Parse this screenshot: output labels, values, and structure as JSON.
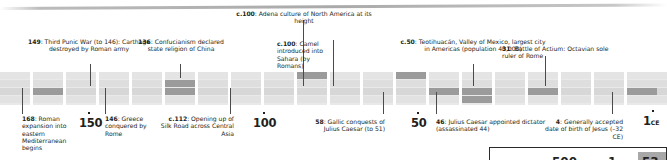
{
  "document": {
    "type": "historical-timeline",
    "period": "2nd century BCE to 1 CE",
    "top_rule": "hairline-divider"
  },
  "events_above": [
    {
      "id": "adena",
      "year_label": "c.100",
      "text": ": Adena culture of North America at its height",
      "lines": [
        "c.100: Adena culture of",
        "North America at its height"
      ],
      "align": "center"
    },
    {
      "id": "punic",
      "year_label": "149",
      "text": ": Third Punic War (to 146): Carthage destroyed by Roman army",
      "lines": [
        "149: Third Punic War",
        "(to 146): Carthage",
        "destroyed by Roman army"
      ],
      "align": "center"
    },
    {
      "id": "confucianism",
      "year_label": "136",
      "text": ": Confucianism declared state religion of China",
      "lines": [
        "136: Confucianism",
        "declared state",
        "religion of China"
      ],
      "align": "center"
    },
    {
      "id": "camel",
      "year_label": "c.100",
      "text": ": Camel introduced into Sahara (by Romans)",
      "lines": [
        "c.100: Camel",
        "introduced into",
        "Sahara (by Romans)"
      ],
      "align": "left"
    },
    {
      "id": "teotihuacan",
      "year_label": "c.50",
      "text": ": Teotihuacán, Valley of Mexico, largest city in Americas (population 40,000)",
      "lines": [
        "c.50: Teotihuacán, Valley",
        "of Mexico, largest city in",
        "Americas (population 40,000)"
      ],
      "align": "center"
    },
    {
      "id": "actium",
      "year_label": "31",
      "text": ": Battle of Actium: Octavian sole ruler of Rome",
      "lines": [
        "31: Battle of Actium:",
        "Octavian sole ruler of Rome"
      ],
      "align": "left"
    }
  ],
  "events_below": [
    {
      "id": "roman-expansion",
      "year_label": "168",
      "text": ": Roman expansion into eastern Mediterranean begins",
      "lines": [
        "168: Roman",
        "expansion",
        "into eastern",
        "Mediterranean",
        "begins"
      ],
      "align": "left"
    },
    {
      "id": "greece",
      "year_label": "146",
      "text": ": Greece conquered by Rome",
      "lines": [
        "146: Greece",
        "conquered",
        "by Rome"
      ],
      "align": "left"
    },
    {
      "id": "silk-road",
      "year_label": "c.112",
      "text": ": Opening up of Silk Road across Central Asia",
      "lines": [
        "c.112: Opening up",
        "of Silk Road across",
        "Central Asia"
      ],
      "align": "right"
    },
    {
      "id": "gallic",
      "year_label": "58",
      "text": ": Gallic conquests of Julius Caesar (to 51)",
      "lines": [
        "58: Gallic",
        "conquests of Julius",
        "Caesar (to 51)"
      ],
      "align": "right"
    },
    {
      "id": "caesar-dictator",
      "year_label": "46",
      "text": ": Julius Caesar appointed dictator (assassinated 44)",
      "lines": [
        "46: Julius Caesar appointed",
        "dictator (assassinated 44)"
      ],
      "align": "left"
    },
    {
      "id": "jesus",
      "year_label": "4",
      "text": ": Generally accepted date of birth of Jesus (–32 CE)",
      "lines": [
        "4: Generally",
        "accepted date of",
        "birth of Jesus (–32 CE)"
      ],
      "align": "right"
    }
  ],
  "axis_ticks": [
    {
      "id": "tick-150",
      "label": "150",
      "era": ""
    },
    {
      "id": "tick-100",
      "label": "100",
      "era": ""
    },
    {
      "id": "tick-50",
      "label": "50",
      "era": ""
    },
    {
      "id": "tick-1ce",
      "label": "1",
      "era": "CE"
    }
  ],
  "scale_box": {
    "start_number": "500",
    "start_era": "BCE",
    "mid_number": "1",
    "mid_era": "CE",
    "chip_number": "53"
  },
  "colors": {
    "text": "#231f20",
    "strip_light": "#e4e4e4",
    "strip_mid": "#dcdcdc",
    "strip_dark": "#9b9b9b",
    "leader": "#4a4a4a",
    "page": "#ffffff"
  }
}
